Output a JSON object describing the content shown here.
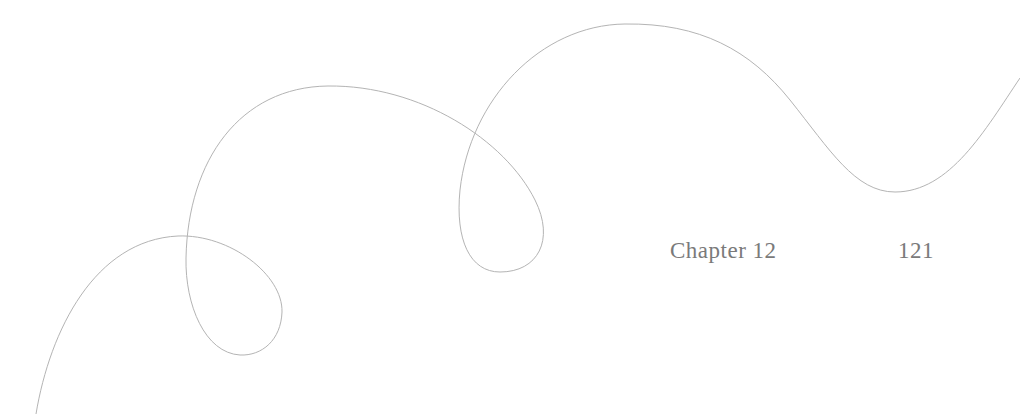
{
  "header": {
    "chapter_label": "Chapter 12",
    "page_number": "121"
  },
  "decoration": {
    "icon": "swirl-line-ornament",
    "stroke_color": "#b4b4b4"
  },
  "colors": {
    "background": "#ffffff",
    "text": "#7a7a7a"
  }
}
